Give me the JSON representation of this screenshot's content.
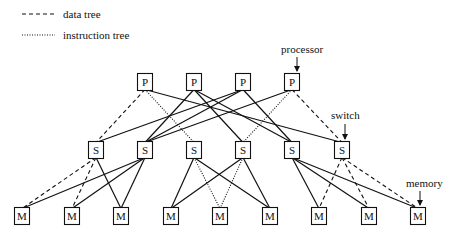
{
  "legend": {
    "items": [
      {
        "style": "dashed",
        "label": "data tree"
      },
      {
        "style": "dotted",
        "label": "instruction tree"
      }
    ]
  },
  "annotations": {
    "processor": "processor",
    "switch": "switch",
    "memory": "memory"
  },
  "nodes": {
    "processors": [
      {
        "id": "P1",
        "label": "P",
        "x": 145,
        "y": 82
      },
      {
        "id": "P2",
        "label": "P",
        "x": 194,
        "y": 82
      },
      {
        "id": "P3",
        "label": "P",
        "x": 243,
        "y": 82
      },
      {
        "id": "P4",
        "label": "P",
        "x": 292,
        "y": 82
      }
    ],
    "switches": [
      {
        "id": "S1",
        "label": "S",
        "x": 96,
        "y": 150
      },
      {
        "id": "S2",
        "label": "S",
        "x": 145,
        "y": 150
      },
      {
        "id": "S3",
        "label": "S",
        "x": 194,
        "y": 150
      },
      {
        "id": "S4",
        "label": "S",
        "x": 243,
        "y": 150
      },
      {
        "id": "S5",
        "label": "S",
        "x": 292,
        "y": 150
      },
      {
        "id": "S6",
        "label": "S",
        "x": 342,
        "y": 150
      }
    ],
    "memories": [
      {
        "id": "M1",
        "label": "M",
        "x": 22,
        "y": 216
      },
      {
        "id": "M2",
        "label": "M",
        "x": 72,
        "y": 216
      },
      {
        "id": "M3",
        "label": "M",
        "x": 121,
        "y": 216
      },
      {
        "id": "M4",
        "label": "M",
        "x": 171,
        "y": 216
      },
      {
        "id": "M5",
        "label": "M",
        "x": 220,
        "y": 216
      },
      {
        "id": "M6",
        "label": "M",
        "x": 270,
        "y": 216
      },
      {
        "id": "M7",
        "label": "M",
        "x": 319,
        "y": 216
      },
      {
        "id": "M8",
        "label": "M",
        "x": 369,
        "y": 216
      },
      {
        "id": "M9",
        "label": "M",
        "x": 418,
        "y": 216
      }
    ]
  },
  "edges": [
    {
      "from": "P1",
      "to": "S1",
      "style": "dashed"
    },
    {
      "from": "P1",
      "to": "S3",
      "style": "dotted"
    },
    {
      "from": "P1",
      "to": "S6",
      "style": "solid"
    },
    {
      "from": "P2",
      "to": "S2",
      "style": "solid"
    },
    {
      "from": "P2",
      "to": "S4",
      "style": "solid"
    },
    {
      "from": "P2",
      "to": "S5",
      "style": "solid"
    },
    {
      "from": "P3",
      "to": "S1",
      "style": "solid"
    },
    {
      "from": "P3",
      "to": "S2",
      "style": "solid"
    },
    {
      "from": "P3",
      "to": "S5",
      "style": "solid"
    },
    {
      "from": "P4",
      "to": "S2",
      "style": "solid"
    },
    {
      "from": "P4",
      "to": "S4",
      "style": "dotted"
    },
    {
      "from": "P4",
      "to": "S6",
      "style": "dashed"
    },
    {
      "from": "S1",
      "to": "M1",
      "style": "dashed"
    },
    {
      "from": "S1",
      "to": "M2",
      "style": "dashed"
    },
    {
      "from": "S1",
      "to": "M3",
      "style": "solid"
    },
    {
      "from": "S2",
      "to": "M1",
      "style": "solid"
    },
    {
      "from": "S2",
      "to": "M2",
      "style": "solid"
    },
    {
      "from": "S2",
      "to": "M3",
      "style": "solid"
    },
    {
      "from": "S3",
      "to": "M4",
      "style": "solid"
    },
    {
      "from": "S3",
      "to": "M5",
      "style": "dotted"
    },
    {
      "from": "S3",
      "to": "M6",
      "style": "solid"
    },
    {
      "from": "S4",
      "to": "M4",
      "style": "solid"
    },
    {
      "from": "S4",
      "to": "M5",
      "style": "dotted"
    },
    {
      "from": "S4",
      "to": "M6",
      "style": "solid"
    },
    {
      "from": "S5",
      "to": "M7",
      "style": "solid"
    },
    {
      "from": "S5",
      "to": "M8",
      "style": "solid"
    },
    {
      "from": "S5",
      "to": "M9",
      "style": "solid"
    },
    {
      "from": "S6",
      "to": "M7",
      "style": "dashed"
    },
    {
      "from": "S6",
      "to": "M8",
      "style": "dashed"
    },
    {
      "from": "S6",
      "to": "M9",
      "style": "dashed"
    }
  ]
}
